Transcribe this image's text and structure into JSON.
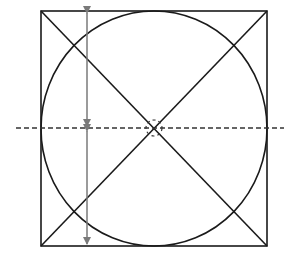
{
  "diagram": {
    "canvas": {
      "width": 286,
      "height": 263
    },
    "colors": {
      "background": "#ffffff",
      "outline": "#1a1a1a",
      "dimension_arrow": "#7a7a7a",
      "center_line": "#333333"
    },
    "square": {
      "x": 41,
      "y": 11,
      "width": 226,
      "height": 235
    },
    "circle": {
      "cx": 154,
      "cy": 128.5,
      "rx": 113,
      "ry": 117.5
    },
    "diagonals": [
      {
        "x1": 41,
        "y1": 11,
        "x2": 267,
        "y2": 246
      },
      {
        "x1": 267,
        "y1": 11,
        "x2": 41,
        "y2": 246
      }
    ],
    "center_line": {
      "x1": 16,
      "y1": 128,
      "x2": 284,
      "y2": 128,
      "style": "dashed"
    },
    "center_marker": {
      "cx": 154,
      "cy": 128,
      "r": 8,
      "style": "dashed"
    },
    "dimension_arrows": [
      {
        "name": "upper-half-height",
        "x": 87,
        "y1": 13,
        "y2": 126
      },
      {
        "name": "lower-half-height",
        "x": 87,
        "y1": 131,
        "y2": 244
      }
    ]
  }
}
